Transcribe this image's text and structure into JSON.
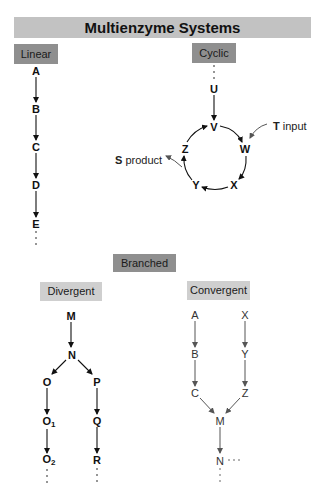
{
  "title": "Multienzyme Systems",
  "sections": {
    "linear": {
      "label": "Linear",
      "nodes": [
        "A",
        "B",
        "C",
        "D",
        "E"
      ],
      "continuation": "⋮"
    },
    "cyclic": {
      "label": "Cyclic",
      "entry": "U",
      "ring": [
        "V",
        "W",
        "X",
        "Y",
        "Z"
      ],
      "input": {
        "species": "T",
        "label": "input"
      },
      "output": {
        "species": "S",
        "label": "product"
      }
    },
    "branched": {
      "label": "Branched",
      "divergent": {
        "label": "Divergent",
        "root": "M",
        "split": "N",
        "left_branch": [
          "O",
          "O1",
          "O2"
        ],
        "left_branch_display": {
          "O": "O",
          "O1_base": "O",
          "O1_sub": "1",
          "O2_base": "O",
          "O2_sub": "2"
        },
        "right_branch": [
          "P",
          "Q",
          "R"
        ]
      },
      "convergent": {
        "label": "Convergent",
        "left_branch": [
          "A",
          "B",
          "C"
        ],
        "right_branch": [
          "X",
          "Y",
          "Z"
        ],
        "merge": "M",
        "next": "N",
        "continuation": "···"
      }
    }
  },
  "colors": {
    "title_bar": "#c2c2c2",
    "dark_tag": "#8f8f8f",
    "light_tag": "#cfcfcf",
    "arrow": "#111111",
    "light_arrow": "#555555"
  }
}
